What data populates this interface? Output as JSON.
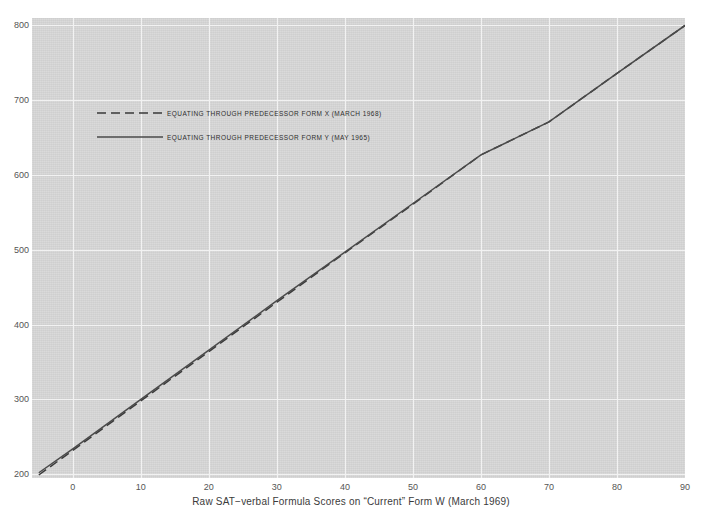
{
  "scan": {
    "header_faint_text": "· · · · · · · · · ·"
  },
  "chart_data": {
    "type": "line",
    "title": "",
    "xlabel": "Raw  SAT−verbal Formula Scores on “Current” Form W  (March 1969)",
    "ylabel": "",
    "xlim": [
      -6,
      90
    ],
    "ylim": [
      195,
      810
    ],
    "xticks": [
      0,
      10,
      20,
      30,
      40,
      50,
      60,
      70,
      80,
      90
    ],
    "yticks": [
      200,
      300,
      400,
      500,
      600,
      700,
      800
    ],
    "xtick_labels": [
      "0",
      "10",
      "20",
      "30",
      "40",
      "50",
      "60",
      "70",
      "80",
      "90"
    ],
    "ytick_labels": [
      "200",
      "300",
      "400",
      "500",
      "600",
      "700",
      "800"
    ],
    "grid": true,
    "grid_color": "#f2f2f2",
    "plot_background": "#d6d6d6",
    "legend_position": "upper left",
    "series": [
      {
        "name": "EQUATING THROUGH PREDECESSOR FORM X  (MARCH 1968)",
        "style": "dashed",
        "color": "#3a3a3a",
        "x": [
          -5,
          0,
          10,
          20,
          30,
          40,
          50,
          60,
          70,
          80,
          90
        ],
        "y": [
          199,
          232,
          298,
          364,
          430,
          496,
          561,
          627,
          671,
          736,
          800
        ]
      },
      {
        "name": "EQUATING THROUGH PREDECESSOR FORM Y  (MAY 1965)",
        "style": "solid",
        "color": "#4a4a4a",
        "x": [
          -5,
          0,
          10,
          20,
          30,
          40,
          50,
          60,
          70,
          80,
          90
        ],
        "y": [
          202,
          234,
          300,
          366,
          432,
          497,
          562,
          627,
          671,
          736,
          800
        ]
      }
    ]
  },
  "legend": {
    "items": [
      {
        "label": "EQUATING THROUGH PREDECESSOR FORM X  (MARCH 1968)",
        "style": "dashed"
      },
      {
        "label": "EQUATING THROUGH PREDECESSOR FORM Y  (MAY 1965)",
        "style": "solid"
      }
    ]
  }
}
